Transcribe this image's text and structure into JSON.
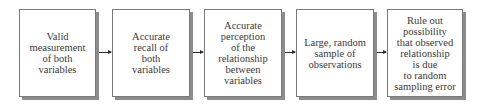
{
  "diagram": {
    "type": "flowchart",
    "direction": "left-to-right",
    "steps": [
      {
        "id": "step-1",
        "label": "Valid\nmeasurement\nof both\nvariables"
      },
      {
        "id": "step-2",
        "label": "Accurate\nrecall of\nboth\nvariables"
      },
      {
        "id": "step-3",
        "label": "Accurate\nperception\nof the\nrelationship\nbetween\nvariables"
      },
      {
        "id": "step-4",
        "label": "Large, random\nsample of\nobservations"
      },
      {
        "id": "step-5",
        "label": "Rule out\npossibility\nthat observed\nrelationship\nis due\nto random\nsampling error"
      }
    ],
    "connections": [
      {
        "from": "step-1",
        "to": "step-2"
      },
      {
        "from": "step-2",
        "to": "step-3"
      },
      {
        "from": "step-3",
        "to": "step-4"
      },
      {
        "from": "step-4",
        "to": "step-5"
      }
    ],
    "colors": {
      "box_border": "#7a7a7a",
      "box_shadow": "#8c8c8c",
      "text": "#3a3a3a",
      "arrow": "#2a2a2a",
      "background": "#ffffff"
    }
  }
}
